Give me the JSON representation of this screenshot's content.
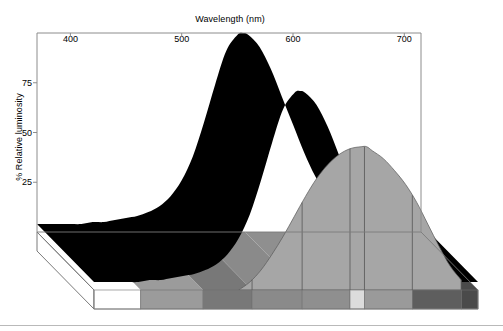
{
  "chart_data": {
    "type": "area",
    "title": "Wavelength (nm)",
    "xlabel": "Wavelength (nm)",
    "ylabel": "% Relative luminosity",
    "xlim": [
      370,
      715
    ],
    "ylim": [
      0,
      100
    ],
    "xticks": [
      400,
      500,
      600,
      700
    ],
    "xtick_labels": [
      "400",
      "500",
      "600",
      "700"
    ],
    "yticks": [
      25,
      50,
      75
    ],
    "ytick_labels": [
      "25",
      "50",
      "75"
    ],
    "grid": false,
    "legend": "none",
    "projection": "3d-extruded-area",
    "series": [
      {
        "name": "Scotopic (back curve)",
        "fill_color": "#000000",
        "x": [
          370,
          380,
          390,
          400,
          410,
          420,
          430,
          440,
          450,
          460,
          470,
          480,
          490,
          500,
          510,
          520,
          530,
          540,
          550,
          555,
          560,
          570,
          580,
          590,
          600,
          610,
          620,
          630,
          640,
          650,
          660,
          670,
          680,
          690,
          700,
          710,
          715
        ],
        "values": [
          4,
          4,
          4,
          4,
          4,
          5,
          5,
          6,
          7,
          8,
          10,
          13,
          18,
          26,
          38,
          55,
          74,
          91,
          99,
          100,
          99,
          93,
          82,
          68,
          54,
          40,
          28,
          19,
          13,
          9,
          7,
          6,
          5,
          4,
          4,
          4,
          4
        ]
      },
      {
        "name": "Photopic (front curve)",
        "fill_color": "#a6a6a6",
        "x": [
          500,
          510,
          520,
          530,
          540,
          550,
          560,
          570,
          580,
          590,
          600,
          610,
          615,
          620,
          630,
          640,
          650,
          660,
          670,
          680,
          690,
          700
        ],
        "values": [
          0,
          4,
          10,
          18,
          27,
          37,
          47,
          56,
          63,
          68,
          71,
          72,
          72,
          70,
          66,
          60,
          53,
          44,
          33,
          22,
          12,
          5
        ]
      }
    ],
    "spectrum_bands": [
      {
        "name": "below-visible",
        "start_nm": 370,
        "end_nm": 412,
        "gray": "#ffffff"
      },
      {
        "name": "violet-blue",
        "start_nm": 412,
        "end_nm": 468,
        "gray": "#9b9b9b"
      },
      {
        "name": "blue-cyan",
        "start_nm": 468,
        "end_nm": 512,
        "gray": "#787878"
      },
      {
        "name": "cyan-green",
        "start_nm": 512,
        "end_nm": 557,
        "gray": "#8a8a8a"
      },
      {
        "name": "green",
        "start_nm": 557,
        "end_nm": 600,
        "gray": "#8f8f8f"
      },
      {
        "name": "yellow",
        "start_nm": 600,
        "end_nm": 613,
        "gray": "#dcdcdc"
      },
      {
        "name": "orange",
        "start_nm": 613,
        "end_nm": 656,
        "gray": "#9a9a9a"
      },
      {
        "name": "red",
        "start_nm": 656,
        "end_nm": 700,
        "gray": "#5e5e5e"
      },
      {
        "name": "deep-red",
        "start_nm": 700,
        "end_nm": 715,
        "gray": "#4a4a4a"
      }
    ],
    "colors": {
      "back_surface": "#000000",
      "front_surface": "#a6a6a6",
      "frame": "#8c8c8c",
      "base_outline": "#7a7a7a",
      "background": "#ffffff",
      "text": "#000000"
    }
  }
}
